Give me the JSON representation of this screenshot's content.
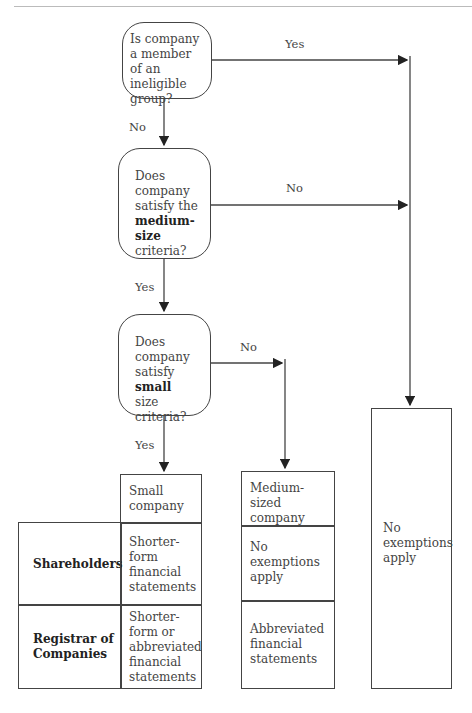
{
  "header": {
    "running_head": "PREPARATION AND FILING OF ANNUAL STATEMENTS    117"
  },
  "decisions": [
    {
      "id": "q1",
      "lines": [
        "Is company",
        "a member",
        "of an ineligible",
        "group?"
      ]
    },
    {
      "id": "q2",
      "lines": [
        "Does",
        "company",
        "satisfy the"
      ],
      "bold": "medium-size",
      "tail": "criteria?"
    },
    {
      "id": "q3",
      "lines": [
        "Does",
        "company"
      ],
      "pre_bold": "satisfy ",
      "bold": "small",
      "tail": "size criteria?"
    }
  ],
  "edge_labels": {
    "q1_yes": "Yes",
    "q1_no": "No",
    "q2_no": "No",
    "q2_yes": "Yes",
    "q3_no": "No",
    "q3_yes": "Yes"
  },
  "small_company": {
    "title": "Small company",
    "rows": [
      {
        "recipient": "Shareholders",
        "value": "Shorter-form financial statements"
      },
      {
        "recipient": "Registrar of Companies",
        "value": "Shorter-form or abbreviated financial statements"
      }
    ]
  },
  "medium_company": {
    "title": "Medium-sized company",
    "rows": [
      "No exemptions apply",
      "Abbreviated financial statements"
    ]
  },
  "no_exemption": {
    "text": "No exemptions apply"
  }
}
